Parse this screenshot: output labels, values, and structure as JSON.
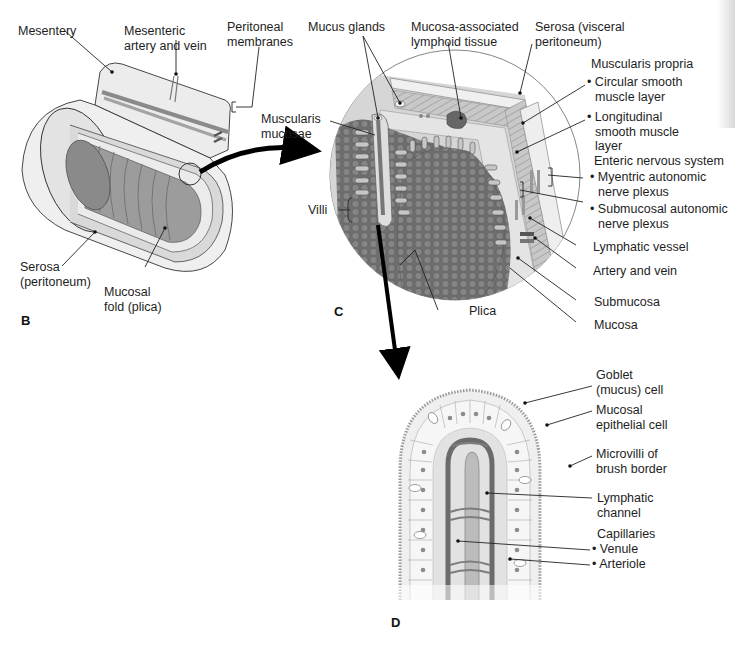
{
  "figure": {
    "panels": {
      "B": "B",
      "C": "C",
      "D": "D"
    },
    "colors": {
      "ink": "#1e1e1e",
      "tissue_light": "#e6e6e6",
      "tissue_mid": "#b9b9b9",
      "tissue_dark": "#7d7d7d",
      "villi_dark": "#5f5f5f"
    }
  },
  "panel_b": {
    "labels": {
      "mesentery": "Mesentery",
      "mesenteric_vessels_1": "Mesenteric",
      "mesenteric_vessels_2": "artery and vein",
      "peritoneal_1": "Peritoneal",
      "peritoneal_2": "membranes",
      "serosa_1": "Serosa",
      "serosa_2": "(peritoneum)",
      "fold_1": "Mucosal",
      "fold_2": "fold (plica)"
    }
  },
  "panel_c": {
    "labels": {
      "mucus_glands": "Mucus glands",
      "malt_1": "Mucosa-associated",
      "malt_2": "lymphoid tissue",
      "serosa_1": "Serosa (visceral",
      "serosa_2": "peritoneum)",
      "muscularis_propria": "Muscularis propria",
      "circular_1": "• Circular smooth",
      "circular_2": "muscle layer",
      "longitudinal_1": "• Longitudinal",
      "longitudinal_2": "smooth muscle",
      "longitudinal_3": "layer",
      "musc_mucosae_1": "Muscularis",
      "musc_mucosae_2": "mucosae",
      "enteric": "Enteric nervous system",
      "myenteric_1": "• Myentric autonomic",
      "myenteric_2": "nerve plexus",
      "submucosal_1": "• Submucosal autonomic",
      "submucosal_2": "nerve plexus",
      "villi": "Villi",
      "lymphatic_vessel": "Lymphatic vessel",
      "artery_vein": "Artery and vein",
      "submucosa": "Submucosa",
      "plica": "Plica",
      "mucosa": "Mucosa"
    }
  },
  "panel_d": {
    "labels": {
      "goblet_1": "Goblet",
      "goblet_2": "(mucus) cell",
      "epithelial_1": "Mucosal",
      "epithelial_2": "epithelial cell",
      "microvilli_1": "Microvilli of",
      "microvilli_2": "brush border",
      "lymph_channel_1": "Lymphatic",
      "lymph_channel_2": "channel",
      "capillaries": "Capillaries",
      "venule": "• Venule",
      "arteriole": "• Arteriole"
    }
  }
}
